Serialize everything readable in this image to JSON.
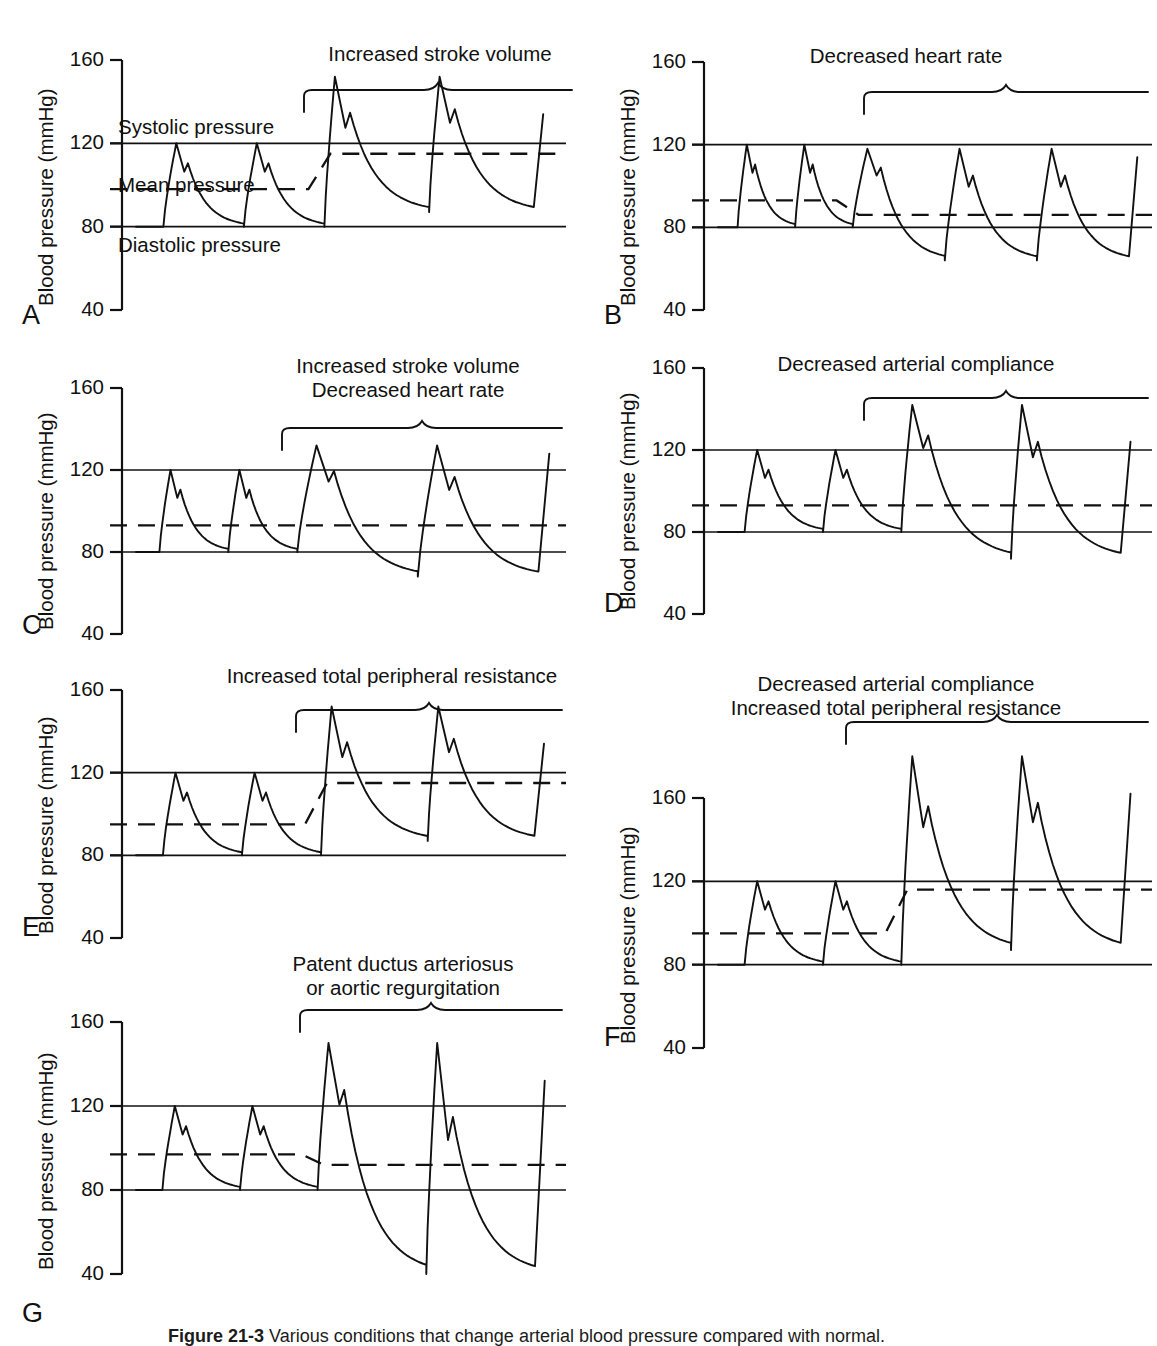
{
  "figure": {
    "caption_prefix": "Figure 21-3",
    "caption_text": "Various conditions that change arterial blood pressure compared with normal.",
    "y_axis_title": "Blood pressure (mmHg)",
    "y_ticks": [
      160,
      120,
      80,
      40
    ],
    "y_min": 40,
    "y_max": 160,
    "reference_lines": {
      "systolic": 120,
      "diastolic": 80,
      "systolic_label": "Systolic pressure",
      "diastolic_label": "Diastolic pressure",
      "mean_label": "Mean pressure"
    }
  },
  "chart_data": {
    "type": "line",
    "title": "Various conditions that change arterial blood pressure compared with normal",
    "xlabel": "",
    "ylabel": "Blood pressure (mmHg)",
    "ylim": [
      40,
      160
    ],
    "grid": false,
    "legend": "none",
    "units": "mmHg",
    "annotations": [
      "Systolic pressure",
      "Mean pressure",
      "Diastolic pressure"
    ],
    "panels": [
      {
        "letter": "A",
        "condition": "Increased stroke volume",
        "condition_lines": [
          "Increased stroke volume"
        ],
        "normal_beats": 2,
        "altered_beats": 2,
        "normal_systolic": 120,
        "normal_diastolic": 80,
        "normal_mean": 98,
        "altered_systolic": 152,
        "altered_diastolic": 87,
        "altered_mean": 115,
        "beat_period_normal": 100,
        "beat_period_altered": 130,
        "shows_inline_labels": true
      },
      {
        "letter": "B",
        "condition": "Decreased heart rate",
        "condition_lines": [
          "Decreased heart rate"
        ],
        "normal_beats": 2,
        "altered_beats": 3,
        "normal_systolic": 120,
        "normal_diastolic": 80,
        "normal_mean": 93,
        "altered_systolic": 118,
        "altered_diastolic": 64,
        "altered_mean": 86,
        "beat_period_normal": 100,
        "beat_period_altered": 160,
        "shows_inline_labels": false
      },
      {
        "letter": "C",
        "condition": "Increased stroke volume / Decreased heart rate",
        "condition_lines": [
          "Increased stroke volume",
          "Decreased heart rate"
        ],
        "normal_beats": 2,
        "altered_beats": 2,
        "normal_systolic": 120,
        "normal_diastolic": 80,
        "normal_mean": 93,
        "altered_systolic": 132,
        "altered_diastolic": 68,
        "altered_mean": 93,
        "beat_period_normal": 100,
        "beat_period_altered": 175,
        "shows_inline_labels": false
      },
      {
        "letter": "D",
        "condition": "Decreased arterial compliance",
        "condition_lines": [
          "Decreased arterial compliance"
        ],
        "normal_beats": 2,
        "altered_beats": 2,
        "normal_systolic": 120,
        "normal_diastolic": 80,
        "normal_mean": 93,
        "altered_systolic": 142,
        "altered_diastolic": 67,
        "altered_mean": 93,
        "beat_period_normal": 100,
        "beat_period_altered": 140,
        "shows_inline_labels": false
      },
      {
        "letter": "E",
        "condition": "Increased total peripheral resistance",
        "condition_lines": [
          "Increased total peripheral resistance"
        ],
        "normal_beats": 2,
        "altered_beats": 2,
        "normal_systolic": 120,
        "normal_diastolic": 80,
        "normal_mean": 95,
        "altered_systolic": 152,
        "altered_diastolic": 87,
        "altered_mean": 115,
        "beat_period_normal": 100,
        "beat_period_altered": 135,
        "shows_inline_labels": false
      },
      {
        "letter": "F",
        "condition": "Decreased arterial compliance / Increased total peripheral resistance",
        "condition_lines": [
          "Decreased arterial compliance",
          "Increased total peripheral resistance"
        ],
        "normal_beats": 2,
        "altered_beats": 2,
        "normal_systolic": 120,
        "normal_diastolic": 80,
        "normal_mean": 95,
        "altered_systolic": 180,
        "altered_diastolic": 87,
        "altered_mean": 116,
        "beat_period_normal": 100,
        "beat_period_altered": 140,
        "shows_inline_labels": false
      },
      {
        "letter": "G",
        "condition": "Patent ductus arteriosus or aortic regurgitation",
        "condition_lines": [
          "Patent ductus arteriosus",
          "or aortic regurgitation"
        ],
        "normal_beats": 2,
        "altered_beats": 2,
        "normal_systolic": 120,
        "normal_diastolic": 80,
        "normal_mean": 97,
        "altered_systolic": 150,
        "altered_diastolic": 40,
        "altered_mean": 92,
        "beat_period_normal": 100,
        "beat_period_altered": 140,
        "shows_inline_labels": false
      }
    ]
  },
  "layout": {
    "panels": [
      {
        "letter": "A",
        "x": 18,
        "y": 60,
        "w": 548,
        "h": 250,
        "label_x": 300,
        "label_y": 42,
        "label_w": 280,
        "brace_x": 300,
        "brace_w": 276,
        "brace_y": 86,
        "letter_x": 22,
        "letter_y": 300
      },
      {
        "letter": "B",
        "x": 600,
        "y": 62,
        "w": 552,
        "h": 248,
        "label_x": 660,
        "label_y": 44,
        "label_w": 492,
        "brace_x": 860,
        "brace_w": 292,
        "brace_y": 88,
        "letter_x": 604,
        "letter_y": 300
      },
      {
        "letter": "C",
        "x": 18,
        "y": 388,
        "w": 548,
        "h": 246,
        "label_x": 250,
        "label_y": 354,
        "label_w": 316,
        "brace_x": 278,
        "brace_w": 288,
        "brace_y": 424,
        "letter_x": 22,
        "letter_y": 610
      },
      {
        "letter": "D",
        "x": 600,
        "y": 368,
        "w": 552,
        "h": 246,
        "label_x": 680,
        "label_y": 352,
        "label_w": 472,
        "brace_x": 860,
        "brace_w": 292,
        "brace_y": 394,
        "letter_x": 604,
        "letter_y": 588
      },
      {
        "letter": "E",
        "x": 18,
        "y": 690,
        "w": 548,
        "h": 248,
        "label_x": 218,
        "label_y": 664,
        "label_w": 348,
        "brace_x": 292,
        "brace_w": 274,
        "brace_y": 706,
        "letter_x": 22,
        "letter_y": 912
      },
      {
        "letter": "F",
        "x": 600,
        "y": 798,
        "w": 552,
        "h": 250,
        "label_x": 640,
        "label_y": 672,
        "label_w": 512,
        "brace_x": 842,
        "brace_w": 310,
        "brace_y": 718,
        "letter_x": 604,
        "letter_y": 1022
      },
      {
        "letter": "G",
        "x": 18,
        "y": 1022,
        "w": 548,
        "h": 252,
        "label_x": 238,
        "label_y": 952,
        "label_w": 330,
        "brace_x": 296,
        "brace_w": 270,
        "brace_y": 1006,
        "letter_x": 22,
        "letter_y": 1298
      }
    ]
  }
}
